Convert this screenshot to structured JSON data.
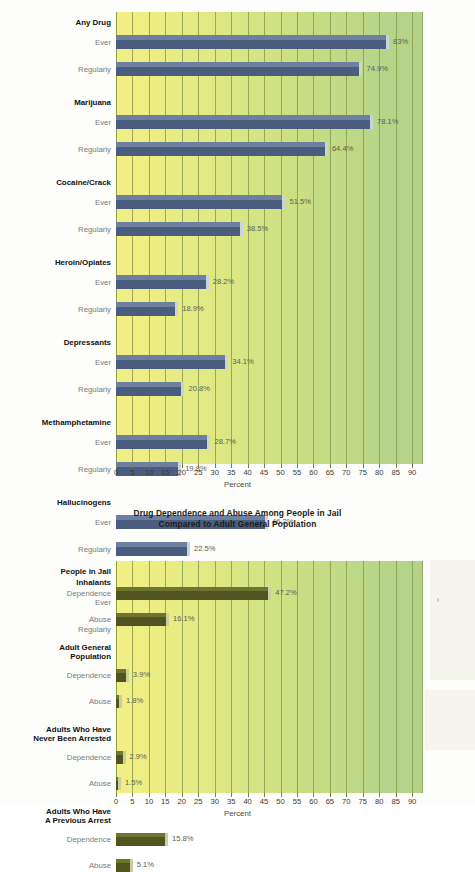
{
  "page": {
    "background": "#fdfdfb"
  },
  "colors": {
    "plot_left": "#f2ef86",
    "plot_right": "#b3d189",
    "gridline": "#8a9e4e",
    "bar_chart1": "#4a5d7e",
    "bar_chart1_highlight": "#6d80a0",
    "bar_chart2": "#4f5421",
    "bar_chart2_highlight": "#6e7530",
    "group_label": "#111111",
    "sub_label": "#7b7b7b",
    "value_label": "#5d5d55"
  },
  "chart_data": [
    {
      "id": "drug-use-chart",
      "type": "bar",
      "orientation": "horizontal",
      "title": "",
      "xlabel": "Percent",
      "ylabel": "",
      "xlim": [
        0,
        93
      ],
      "xticks": [
        0,
        5,
        10,
        15,
        20,
        25,
        30,
        35,
        40,
        45,
        50,
        55,
        60,
        65,
        70,
        75,
        80,
        85,
        90
      ],
      "xticklabels": [
        "0",
        "5",
        "10",
        "15",
        "20",
        "25",
        "30",
        "35",
        "40",
        "45",
        "50",
        "55",
        "60",
        "65",
        "70",
        "75",
        "80",
        "85",
        "90"
      ],
      "grid": true,
      "legend": "none",
      "series": [
        {
          "name": "Ever",
          "values": [
            83,
            78.1,
            51.5,
            28.2,
            34.1,
            28.7,
            46.2,
            16.9
          ]
        },
        {
          "name": "Regularly",
          "values": [
            74.9,
            64.4,
            38.5,
            18.9,
            20.8,
            19.8,
            22.5,
            5
          ]
        }
      ],
      "categories": [
        "Any Drug",
        "Marijuana",
        "Cocaine/Crack",
        "Heroin/Opiates",
        "Depressants",
        "Methamphetamine",
        "Hallucinogens",
        "Inhalants"
      ],
      "groups": [
        {
          "label": "Any Drug",
          "rows": [
            {
              "label": "Ever",
              "value": 83,
              "value_label": "83%"
            },
            {
              "label": "Regularly",
              "value": 74.9,
              "value_label": "74.9%"
            }
          ]
        },
        {
          "label": "Marijuana",
          "rows": [
            {
              "label": "Ever",
              "value": 78.1,
              "value_label": "78.1%"
            },
            {
              "label": "Regularly",
              "value": 64.4,
              "value_label": "64.4%"
            }
          ]
        },
        {
          "label": "Cocaine/Crack",
          "rows": [
            {
              "label": "Ever",
              "value": 51.5,
              "value_label": "51.5%"
            },
            {
              "label": "Regularly",
              "value": 38.5,
              "value_label": "38.5%"
            }
          ]
        },
        {
          "label": "Heroin/Opiates",
          "rows": [
            {
              "label": "Ever",
              "value": 28.2,
              "value_label": "28.2%"
            },
            {
              "label": "Regularly",
              "value": 18.9,
              "value_label": "18.9%"
            }
          ]
        },
        {
          "label": "Depressants",
          "rows": [
            {
              "label": "Ever",
              "value": 34.1,
              "value_label": "34.1%"
            },
            {
              "label": "Regularly",
              "value": 20.8,
              "value_label": "20.8%"
            }
          ]
        },
        {
          "label": "Methamphetamine",
          "rows": [
            {
              "label": "Ever",
              "value": 28.7,
              "value_label": "28.7%"
            },
            {
              "label": "Regularly",
              "value": 19.8,
              "value_label": "19.8%"
            }
          ]
        },
        {
          "label": "Hallucinogens",
          "rows": [
            {
              "label": "Ever",
              "value": 46.2,
              "value_label": "46.2%"
            },
            {
              "label": "Regularly",
              "value": 22.5,
              "value_label": "22.5%"
            }
          ]
        },
        {
          "label": "Inhalants",
          "rows": [
            {
              "label": "Ever",
              "value": 16.9,
              "value_label": "16.9%"
            },
            {
              "label": "Regularly",
              "value": 5,
              "value_label": "5%"
            }
          ]
        }
      ]
    },
    {
      "id": "dependence-abuse-chart",
      "type": "bar",
      "orientation": "horizontal",
      "title_line1": "Drug Dependence and Abuse Among People in Jail",
      "title_line2": "Compared to Adult General Population",
      "xlabel": "Percent",
      "ylabel": "",
      "xlim": [
        0,
        93
      ],
      "xticks": [
        0,
        5,
        10,
        15,
        20,
        25,
        30,
        35,
        40,
        45,
        50,
        55,
        60,
        65,
        70,
        75,
        80,
        85,
        90
      ],
      "xticklabels": [
        "0",
        "5",
        "10",
        "15",
        "20",
        "25",
        "30",
        "35",
        "40",
        "45",
        "50",
        "55",
        "60",
        "65",
        "70",
        "75",
        "80",
        "85",
        "90"
      ],
      "grid": true,
      "legend": "none",
      "series": [
        {
          "name": "Dependence",
          "values": [
            47.2,
            3.9,
            2.9,
            15.8
          ]
        },
        {
          "name": "Abuse",
          "values": [
            16.1,
            1.8,
            1.5,
            5.1
          ]
        }
      ],
      "categories": [
        "People in Jail",
        "Adult General Population",
        "Adults Who Have Never Been Arrested",
        "Adults Who Have A Previous Arrest"
      ],
      "groups": [
        {
          "label": "People in Jail",
          "label_lines": [
            "People in Jail"
          ],
          "rows": [
            {
              "label": "Dependence",
              "value": 47.2,
              "value_label": "47.2%"
            },
            {
              "label": "Abuse",
              "value": 16.1,
              "value_label": "16.1%"
            }
          ]
        },
        {
          "label": "Adult General Population",
          "label_lines": [
            "Adult General",
            "Population"
          ],
          "rows": [
            {
              "label": "Dependence",
              "value": 3.9,
              "value_label": "3.9%"
            },
            {
              "label": "Abuse",
              "value": 1.8,
              "value_label": "1.8%"
            }
          ]
        },
        {
          "label": "Adults Who Have Never Been Arrested",
          "label_lines": [
            "Adults Who Have",
            "Never Been Arrested"
          ],
          "rows": [
            {
              "label": "Dependence",
              "value": 2.9,
              "value_label": "2.9%"
            },
            {
              "label": "Abuse",
              "value": 1.5,
              "value_label": "1.5%"
            }
          ]
        },
        {
          "label": "Adults Who Have A Previous Arrest",
          "label_lines": [
            "Adults Who Have",
            "A Previous Arrest"
          ],
          "rows": [
            {
              "label": "Dependence",
              "value": 15.8,
              "value_label": "15.8%"
            },
            {
              "label": "Abuse",
              "value": 5.1,
              "value_label": "5.1%"
            }
          ]
        }
      ]
    }
  ]
}
